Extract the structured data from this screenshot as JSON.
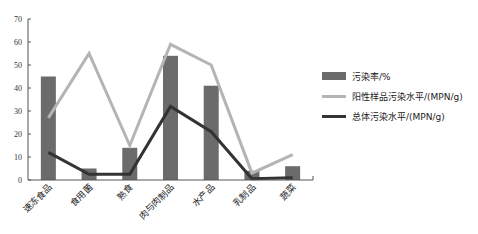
{
  "chart_data": {
    "type": "bar+line",
    "title": "",
    "xlabel": "",
    "ylabel": "",
    "ylim": [
      0,
      70
    ],
    "yticks": [
      0,
      10,
      20,
      30,
      40,
      50,
      60,
      70
    ],
    "grid": false,
    "legend_position": "right",
    "categories": [
      "速冻食品",
      "食用菌",
      "熟食",
      "肉与肉制品",
      "水产品",
      "乳制品",
      "蔬菜"
    ],
    "series": [
      {
        "name": "污染率/%",
        "type": "bar",
        "color": "#6b6b6b",
        "values": [
          45,
          5,
          14,
          54,
          41,
          4,
          6
        ]
      },
      {
        "name": "阳性样品污染水平/(MPN/g)",
        "type": "line",
        "color": "#b4b4b4",
        "values": [
          27,
          55,
          15,
          59,
          50,
          3,
          11
        ]
      },
      {
        "name": "总体污染水平/(MPN/g)",
        "type": "line",
        "color": "#333333",
        "values": [
          12,
          2.5,
          2.5,
          32,
          21,
          0.5,
          1
        ]
      }
    ]
  },
  "legend": {
    "items": [
      {
        "label": "污染率/%"
      },
      {
        "label": "阳性样品污染水平/(MPN/g)"
      },
      {
        "label": "总体污染水平/(MPN/g)"
      }
    ]
  }
}
